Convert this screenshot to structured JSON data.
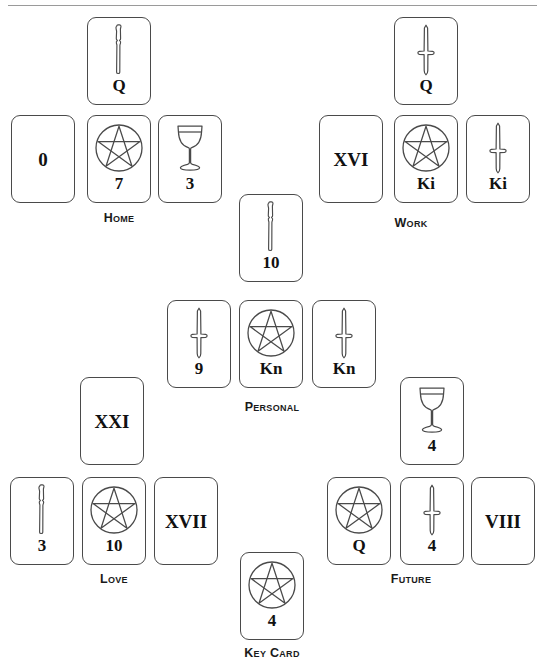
{
  "page": {
    "background_color": "#ffffff",
    "rule_color": "#9a9a9a",
    "card_border_color": "#4a4a4a",
    "text_color": "#111111",
    "width": 545,
    "height": 667
  },
  "groups": [
    {
      "id": "home",
      "label": "Home",
      "label_x": 119,
      "label_y": 211,
      "top_card": {
        "rank": "Q",
        "suit": "wand",
        "x": 87,
        "y": 17
      },
      "row_cards": [
        {
          "rank": "0",
          "suit": "major",
          "x": 11,
          "y": 115
        },
        {
          "rank": "7",
          "suit": "pentacle",
          "x": 87,
          "y": 115
        },
        {
          "rank": "3",
          "suit": "cup",
          "x": 158,
          "y": 115
        }
      ]
    },
    {
      "id": "work",
      "label": "Work",
      "label_x": 411,
      "label_y": 216,
      "top_card": {
        "rank": "Q",
        "suit": "sword",
        "x": 394,
        "y": 17
      },
      "row_cards": [
        {
          "rank": "XVI",
          "suit": "major",
          "x": 319,
          "y": 115
        },
        {
          "rank": "Ki",
          "suit": "pentacle",
          "x": 394,
          "y": 115
        },
        {
          "rank": "Ki",
          "suit": "sword",
          "x": 466,
          "y": 115
        }
      ]
    },
    {
      "id": "personal",
      "label": "Personal",
      "label_x": 272,
      "label_y": 400,
      "top_card": {
        "rank": "10",
        "suit": "wand",
        "x": 239,
        "y": 194
      },
      "row_cards": [
        {
          "rank": "9",
          "suit": "sword",
          "x": 167,
          "y": 300
        },
        {
          "rank": "Kn",
          "suit": "pentacle",
          "x": 239,
          "y": 300
        },
        {
          "rank": "Kn",
          "suit": "sword",
          "x": 312,
          "y": 300
        }
      ]
    },
    {
      "id": "love",
      "label": "Love",
      "label_x": 114,
      "label_y": 572,
      "top_card": {
        "rank": "XXI",
        "suit": "major",
        "x": 80,
        "y": 377
      },
      "row_cards": [
        {
          "rank": "3",
          "suit": "wand",
          "x": 10,
          "y": 477
        },
        {
          "rank": "10",
          "suit": "pentacle",
          "x": 82,
          "y": 477
        },
        {
          "rank": "XVII",
          "suit": "major",
          "x": 154,
          "y": 477
        }
      ]
    },
    {
      "id": "future",
      "label": "Future",
      "label_x": 411,
      "label_y": 572,
      "top_card": {
        "rank": "4",
        "suit": "cup",
        "x": 400,
        "y": 377
      },
      "row_cards": [
        {
          "rank": "Q",
          "suit": "pentacle",
          "x": 327,
          "y": 477
        },
        {
          "rank": "4",
          "suit": "sword",
          "x": 400,
          "y": 477
        },
        {
          "rank": "VIII",
          "suit": "major",
          "x": 471,
          "y": 477
        }
      ]
    }
  ],
  "key_card": {
    "label": "Key Card",
    "label_x": 272,
    "label_y": 646,
    "card": {
      "rank": "4",
      "suit": "pentacle",
      "x": 240,
      "y": 552
    }
  },
  "icons": {
    "wand": "wand-icon",
    "cup": "cup-icon",
    "sword": "sword-icon",
    "pentacle": "pentacle-icon"
  }
}
